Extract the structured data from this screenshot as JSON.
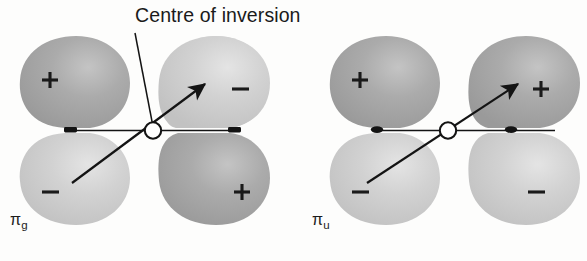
{
  "figure": {
    "width": 587,
    "height": 261,
    "background_color": "#fdfdfc",
    "annotation_label": "Centre of inversion",
    "stroke_color": "#141414",
    "lobe_dark_color": "#a8a8a8",
    "lobe_light_color": "#cdcdcd",
    "sign_color": "#1a1a1a"
  },
  "diagrams": [
    {
      "id": "pi-g",
      "label_pi": "π",
      "label_sub": "g",
      "lobes": [
        {
          "position": "top-left",
          "sign": "+",
          "shade": "dark"
        },
        {
          "position": "top-right",
          "sign": "−",
          "shade": "light"
        },
        {
          "position": "bottom-left",
          "sign": "−",
          "shade": "light"
        },
        {
          "position": "bottom-right",
          "sign": "+",
          "shade": "dark"
        }
      ],
      "has_centre_of_inversion_marker": true,
      "inversion_arrow": "bottom-left to top-right"
    },
    {
      "id": "pi-u",
      "label_pi": "π",
      "label_sub": "u",
      "lobes": [
        {
          "position": "top-left",
          "sign": "+",
          "shade": "dark"
        },
        {
          "position": "top-right",
          "sign": "+",
          "shade": "dark"
        },
        {
          "position": "bottom-left",
          "sign": "−",
          "shade": "light"
        },
        {
          "position": "bottom-right",
          "sign": "−",
          "shade": "light"
        }
      ],
      "has_centre_of_inversion_marker": true,
      "inversion_arrow": "bottom-left to top-right"
    }
  ]
}
